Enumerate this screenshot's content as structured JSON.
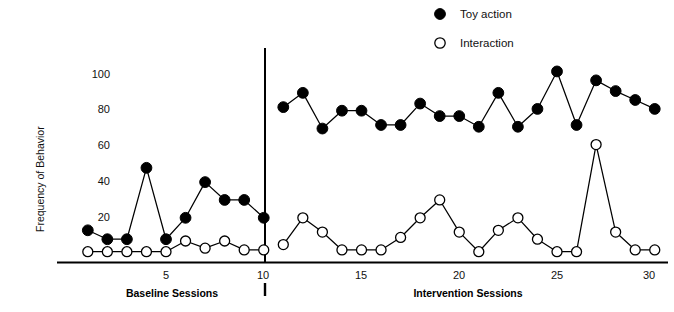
{
  "chart_data": {
    "type": "line",
    "title": "",
    "subtitle": "",
    "xlabel": "",
    "ylabel": "Frequency of Behavior",
    "ylim": [
      0,
      108
    ],
    "xlim": [
      0.3,
      31.2
    ],
    "grid": false,
    "legend_position": "top-center-right",
    "y_ticks": [
      0,
      20,
      40,
      60,
      80,
      100
    ],
    "y_tick_labels": [
      "0",
      "20",
      "40",
      "60",
      "80",
      "100"
    ],
    "x_ticks": [
      5,
      10,
      15,
      20,
      25,
      30
    ],
    "x_tick_labels": [
      "5",
      "10",
      "15",
      "20",
      "25",
      "30"
    ],
    "x": [
      1,
      2,
      3,
      4,
      5,
      6,
      7,
      8,
      9,
      10,
      11,
      12,
      13,
      14,
      15,
      16,
      17,
      18,
      19,
      20,
      21,
      22,
      23,
      24,
      25,
      26,
      27,
      28,
      29,
      30
    ],
    "series": [
      {
        "name": "Toy action",
        "marker": "filled-circle",
        "color": "#000000",
        "values": [
          13,
          8,
          8,
          48,
          8,
          20,
          40,
          30,
          30,
          20,
          82,
          90,
          70,
          80,
          80,
          72,
          72,
          84,
          77,
          77,
          71,
          90,
          71,
          81,
          102,
          72,
          97,
          91,
          86,
          81
        ]
      },
      {
        "name": "Interaction",
        "marker": "open-circle",
        "color": "#000000",
        "values": [
          1,
          1,
          1,
          1,
          1,
          7,
          3,
          7,
          2,
          2,
          5,
          20,
          12,
          2,
          2,
          2,
          9,
          20,
          30,
          12,
          1,
          13,
          20,
          8,
          1,
          1,
          61,
          12,
          2,
          2
        ]
      }
    ],
    "phases": [
      {
        "label": "Baseline Sessions",
        "x_start": 1,
        "x_end": 10
      },
      {
        "label": "Intervention Sessions",
        "x_start": 11,
        "x_end": 30
      }
    ],
    "phase_divider_x": 10.5,
    "annotations": []
  },
  "legend": {
    "items": [
      {
        "label": "Toy action",
        "marker": "filled-circle"
      },
      {
        "label": "Interaction",
        "marker": "open-circle"
      }
    ]
  },
  "axes": {
    "y_title": "Frequency of Behavior"
  }
}
